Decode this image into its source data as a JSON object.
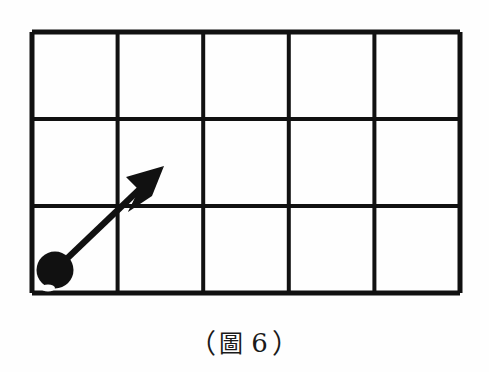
{
  "figure": {
    "name": "grid-with-arrow-diagram",
    "background_color": "#fefefe",
    "ink_color": "#111111",
    "grid": {
      "columns": 5,
      "rows": 3,
      "left": 32,
      "top": 32,
      "right": 460,
      "bottom": 293,
      "cell_width": 85.6,
      "cell_height": 87,
      "outer_line_width": 5,
      "inner_line_width": 4,
      "vertical_line_x": [
        32,
        117.6,
        203.2,
        288.8,
        374.4,
        460
      ],
      "horizontal_line_y": [
        32,
        119,
        206,
        293
      ]
    },
    "ball": {
      "label": "ball",
      "center_x": 55,
      "center_y": 270,
      "radius": 18,
      "fill": "#111111"
    },
    "arrow": {
      "label": "velocity-arrow",
      "start_x": 55,
      "start_y": 270,
      "tip_x": 164,
      "tip_y": 166,
      "shaft_width": 6,
      "head_length": 40,
      "head_half_width": 19,
      "head_notch": 11,
      "fill": "#111111",
      "grid_units_right": 1.27,
      "grid_units_up": 1.2
    }
  },
  "caption": {
    "name": "figure-caption",
    "full_text": "（圖 6）",
    "open_paren": "（",
    "cjk_character": "圖",
    "number": "6",
    "close_paren": "）"
  }
}
